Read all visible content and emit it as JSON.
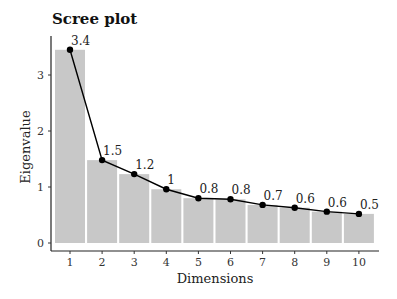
{
  "chart_data": {
    "type": "bar",
    "title": "Scree plot",
    "xlabel": "Dimensions",
    "ylabel": "Eigenvalue",
    "categories": [
      "1",
      "2",
      "3",
      "4",
      "5",
      "6",
      "7",
      "8",
      "9",
      "10"
    ],
    "values": [
      3.45,
      1.48,
      1.23,
      0.96,
      0.8,
      0.78,
      0.68,
      0.63,
      0.56,
      0.52
    ],
    "data_labels": [
      "3.4",
      "1.5",
      "1.2",
      "1",
      "0.8",
      "0.8",
      "0.7",
      "0.6",
      "0.6",
      "0.5"
    ],
    "yticks": [
      0,
      1,
      2,
      3
    ],
    "ylim": [
      0,
      3.6
    ],
    "series": [
      {
        "name": "bars",
        "type": "bar",
        "color": "#c8c8c8",
        "values": [
          3.45,
          1.48,
          1.23,
          0.96,
          0.8,
          0.78,
          0.68,
          0.63,
          0.56,
          0.52
        ]
      },
      {
        "name": "line",
        "type": "line",
        "color": "#000000",
        "values": [
          3.45,
          1.48,
          1.23,
          0.96,
          0.8,
          0.78,
          0.68,
          0.63,
          0.56,
          0.52
        ]
      }
    ],
    "grid": false,
    "legend": "none"
  }
}
